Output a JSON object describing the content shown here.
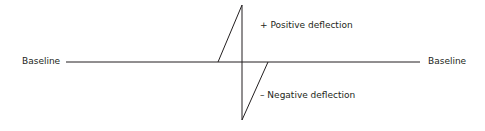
{
  "diagram": {
    "labels": {
      "baseline_left": "Baseline",
      "baseline_right": "Baseline",
      "positive": "+ Positive deflection",
      "negative": "– Negative deflection"
    },
    "colors": {
      "line": "#231f20",
      "text": "#231f20"
    }
  }
}
